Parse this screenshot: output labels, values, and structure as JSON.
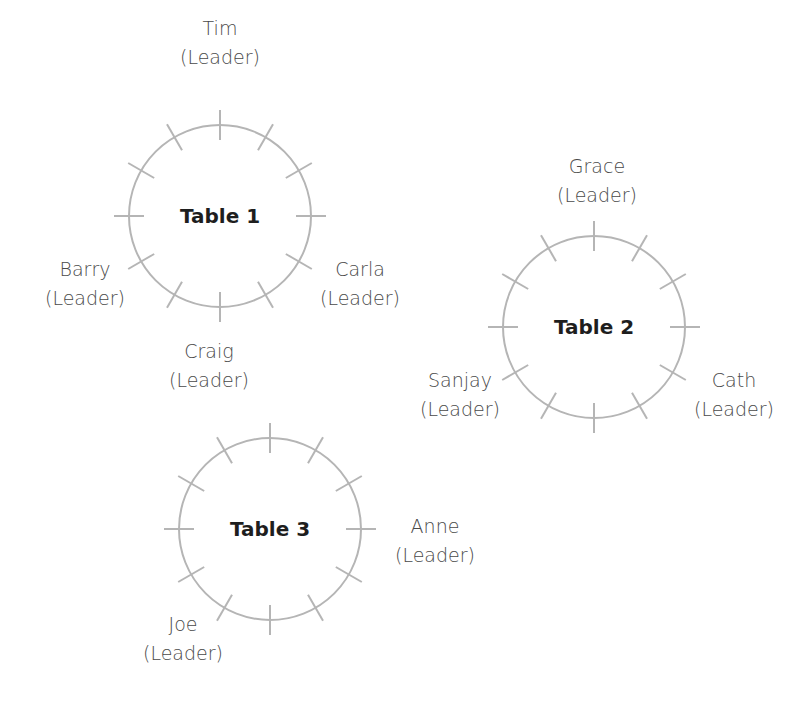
{
  "colors": {
    "circle": "#b5b5b5",
    "label_text": "#4a4a4a",
    "table_title": "#1e1e1e"
  },
  "tables": [
    {
      "name": "Table 1",
      "seats": 12,
      "leaders": [
        {
          "name": "Tim",
          "role": "(Leader)"
        },
        {
          "name": "Barry",
          "role": "(Leader)"
        },
        {
          "name": "Carla",
          "role": "(Leader)"
        }
      ]
    },
    {
      "name": "Table 2",
      "seats": 12,
      "leaders": [
        {
          "name": "Grace",
          "role": "(Leader)"
        },
        {
          "name": "Sanjay",
          "role": "(Leader)"
        },
        {
          "name": "Cath",
          "role": "(Leader)"
        }
      ]
    },
    {
      "name": "Table 3",
      "seats": 12,
      "leaders": [
        {
          "name": "Craig",
          "role": "(Leader)"
        },
        {
          "name": "Anne",
          "role": "(Leader)"
        },
        {
          "name": "Joe",
          "role": "(Leader)"
        }
      ]
    }
  ]
}
